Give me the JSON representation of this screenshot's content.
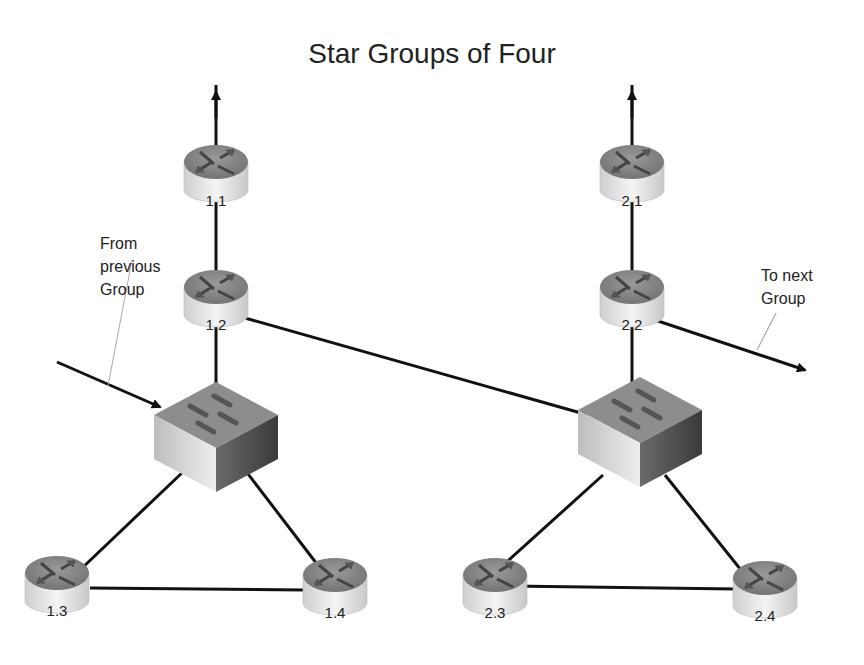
{
  "title": "Star Groups of Four",
  "annotations": {
    "from_previous": [
      "From",
      "previous",
      "Group"
    ],
    "to_next": [
      "To next",
      "Group"
    ]
  },
  "nodes": {
    "g1": {
      "r1": "1.1",
      "r2": "1.2",
      "r3": "1.3",
      "r4": "1.4"
    },
    "g2": {
      "r1": "2.1",
      "r2": "2.2",
      "r3": "2.3",
      "r4": "2.4"
    }
  },
  "colors": {
    "line": "#111111",
    "router_top": "#8a8a8a",
    "router_body": "#e6e6e6",
    "switch": "#9a9a9a"
  }
}
